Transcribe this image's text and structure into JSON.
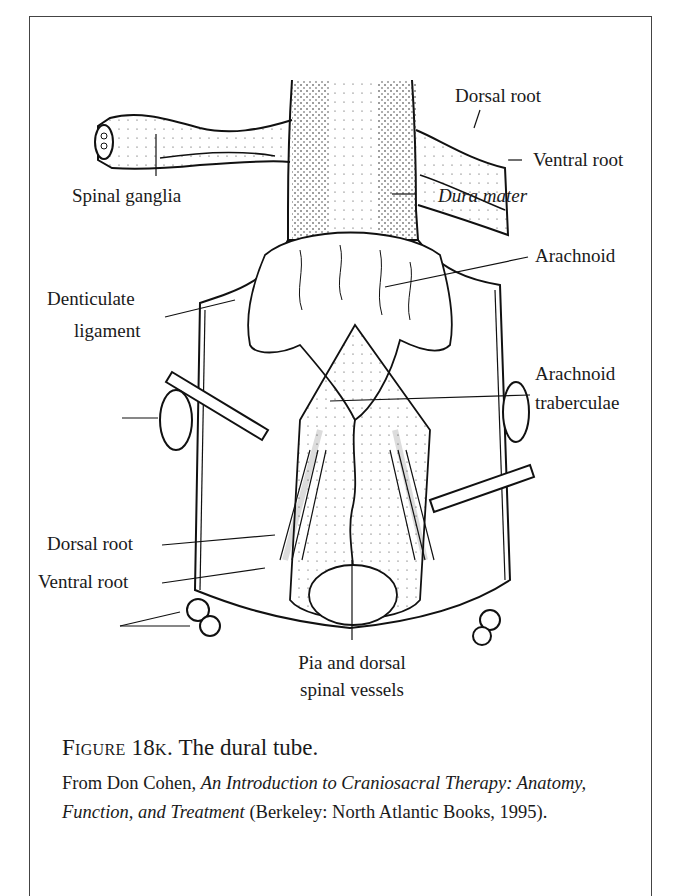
{
  "figure": {
    "labels": {
      "dorsal_root_top": "Dorsal root",
      "ventral_root_top": "Ventral root",
      "spinal_ganglia": "Spinal ganglia",
      "dura_mater": "Dura mater",
      "arachnoid": "Arachnoid",
      "denticulate_ligament_line1": "Denticulate",
      "denticulate_ligament_line2": "ligament",
      "arachnoid_traberculae_line1": "Arachnoid",
      "arachnoid_traberculae_line2": "traberculae",
      "dorsal_root_bottom": "Dorsal root",
      "ventral_root_bottom": "Ventral root",
      "pia_line1": "Pia and dorsal",
      "pia_line2": "spinal vessels"
    },
    "caption": {
      "figure_label": "Figure 18k.",
      "title": "The dural tube.",
      "source_prefix": "From Don Cohen, ",
      "source_book": "An Introduction to Craniosacral Therapy: Anatomy, Function, and Treatment",
      "source_suffix": " (Berkeley: North Atlantic Books, 1995)."
    }
  }
}
